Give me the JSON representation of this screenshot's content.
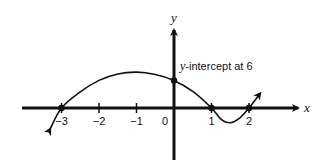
{
  "chart_data": {
    "type": "line",
    "title": "",
    "xlabel": "x",
    "ylabel": "y",
    "xlim": [
      -3.9,
      3.4
    ],
    "ylim": [
      -8,
      10
    ],
    "x_ticks": [
      -3,
      -2,
      -1,
      0,
      1,
      2
    ],
    "x_tick_labels": [
      "−3",
      "−2",
      "−1",
      "0",
      "1",
      "2"
    ],
    "grid": false,
    "series": [
      {
        "name": "f(x)",
        "x": [
          -3.3,
          -3,
          -2.5,
          -2,
          -1.5,
          -1,
          -0.5,
          0,
          0.5,
          1,
          1.25,
          1.5,
          1.75,
          2,
          2.3
        ],
        "y": [
          -4.5,
          0,
          3.5,
          6,
          7.4,
          7.8,
          7.3,
          6,
          3.6,
          0,
          -2.4,
          -3.2,
          -2.2,
          0,
          3.2
        ]
      }
    ],
    "marked_points": [
      {
        "x": -3,
        "y": 0
      },
      {
        "x": 0,
        "y": 6
      },
      {
        "x": 1,
        "y": 0
      },
      {
        "x": 2,
        "y": 0
      }
    ],
    "annotations": [
      {
        "text_italic": "y",
        "text": "-intercept at 6",
        "x": 0,
        "y": 6
      }
    ]
  }
}
